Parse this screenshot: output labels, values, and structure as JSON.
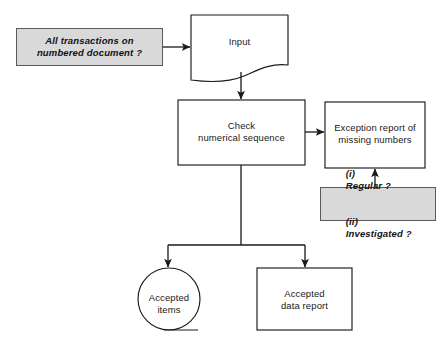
{
  "diagram": {
    "background_color": "#ffffff",
    "line_color": "#1a1a1a",
    "annotation_fill": "#d9d9d9",
    "annotation_border": "#5a5a5a"
  },
  "nodes": {
    "input": {
      "label": "Input",
      "shape": "document"
    },
    "check": {
      "label": "Check\nnumerical sequence",
      "shape": "process"
    },
    "exception": {
      "label": "Exception report of\nmissing numbers",
      "shape": "process"
    },
    "accepted_items": {
      "label": "Accepted\nitems",
      "shape": "magnetic-tape"
    },
    "accepted_report": {
      "label": "Accepted\ndata report",
      "shape": "process"
    }
  },
  "annotations": {
    "transactions": {
      "line1": "All transactions on",
      "line2": "numbered document ?"
    },
    "regular": {
      "line1_marker": "(i)",
      "line1_text": "Regular ?",
      "line2_marker": "(ii)",
      "line2_text": "Investigated ?"
    }
  },
  "connectors": [
    {
      "name": "annotation-to-input",
      "from": "transactions-annotation",
      "to": "input",
      "direction": "right"
    },
    {
      "name": "input-to-check",
      "from": "input",
      "to": "check",
      "direction": "down"
    },
    {
      "name": "check-to-exception",
      "from": "check",
      "to": "exception",
      "direction": "right"
    },
    {
      "name": "regular-annotation-to-exception",
      "from": "regular-annotation",
      "to": "exception",
      "direction": "up"
    },
    {
      "name": "check-to-accepted-items",
      "from": "check",
      "to": "accepted_items",
      "direction": "down-left"
    },
    {
      "name": "check-to-accepted-report",
      "from": "check",
      "to": "accepted_report",
      "direction": "down-right"
    }
  ]
}
